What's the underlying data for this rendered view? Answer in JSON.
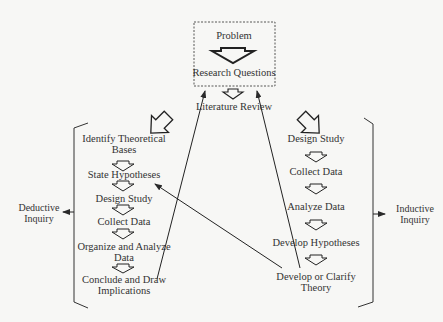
{
  "diagram": {
    "top_box": {
      "problem": "Problem",
      "research_questions": "Research Questions"
    },
    "literature_review": "Literature Review",
    "deductive": {
      "label_line1": "Deductive",
      "label_line2": "Inquiry",
      "steps": [
        {
          "line1": "Identify Theoretical",
          "line2": "Bases"
        },
        {
          "line1": "State Hypotheses",
          "line2": ""
        },
        {
          "line1": "Design Study",
          "line2": ""
        },
        {
          "line1": "Collect Data",
          "line2": ""
        },
        {
          "line1": "Organize and Analyze",
          "line2": "Data"
        },
        {
          "line1": "Conclude and Draw",
          "line2": "Implications"
        }
      ]
    },
    "inductive": {
      "label_line1": "Inductive",
      "label_line2": "Inquiry",
      "steps": [
        {
          "line1": "Design Study",
          "line2": ""
        },
        {
          "line1": "Collect Data",
          "line2": ""
        },
        {
          "line1": "Analyze Data",
          "line2": ""
        },
        {
          "line1": "Develop Hypotheses",
          "line2": ""
        },
        {
          "line1": "Develop or Clarify",
          "line2": "Theory"
        }
      ]
    },
    "colors": {
      "line": "#2a2a2a",
      "background": "#f7f7f5"
    }
  }
}
